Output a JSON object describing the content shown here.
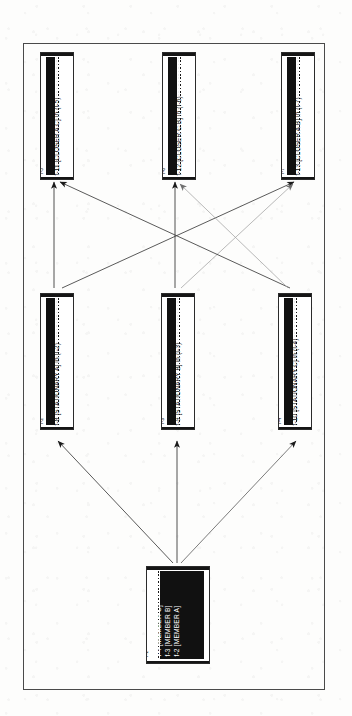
{
  "document": {
    "kind": "frame-network-diagram",
    "orientation": "rotated-90"
  },
  "frame": {
    "border_color": "#4a4a4a"
  },
  "nodes": [
    {
      "key": "f11",
      "id": "I-5",
      "label": "f-11 [CLOSER A C] in (I-5)",
      "row": "top",
      "column": "left"
    },
    {
      "key": "f12",
      "id": "I-6",
      "label": "f-12 [CLOSER C B] in (I-6)",
      "row": "top",
      "column": "center"
    },
    {
      "key": "f13",
      "id": "I-7",
      "label": "f-13 [CLOSER A B] in (I-7)",
      "row": "top",
      "column": "right"
    },
    {
      "key": "f8",
      "id": "I-2",
      "label": "f-8 [STATIONARY A] in (I-2)",
      "row": "middle",
      "column": "left"
    },
    {
      "key": "f9",
      "id": "I-3",
      "label": "f-9 [STATIONARY B] in (I-3)",
      "row": "middle",
      "column": "center"
    },
    {
      "key": "f10",
      "id": "I-4",
      "label": "f-10 [STATIONARY C] in (I-4)",
      "row": "middle",
      "column": "right"
    }
  ],
  "root_node": {
    "key": "root",
    "id": "I-1",
    "lines": [
      "f-4 [MEMBER C]",
      "f-3 [MEMBER B]",
      "f-2 [MEMBER A]"
    ]
  },
  "edges": [
    {
      "from": "root",
      "to": "f8",
      "style": "solid"
    },
    {
      "from": "root",
      "to": "f9",
      "style": "solid"
    },
    {
      "from": "root",
      "to": "f10",
      "style": "solid"
    },
    {
      "from": "f8",
      "to": "f11",
      "style": "solid"
    },
    {
      "from": "f8",
      "to": "f13",
      "style": "solid"
    },
    {
      "from": "f9",
      "to": "f12",
      "style": "solid"
    },
    {
      "from": "f9",
      "to": "f13",
      "style": "faint"
    },
    {
      "from": "f10",
      "to": "f11",
      "style": "solid"
    },
    {
      "from": "f10",
      "to": "f12",
      "style": "faint"
    }
  ],
  "colors": {
    "ink": "#111111",
    "edge": "#3c3c3c",
    "edge_faint": "#9a9a9a",
    "paper": "#fdfdfc"
  }
}
